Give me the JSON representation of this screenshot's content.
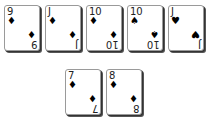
{
  "table": {
    "top_row": [
      {
        "rank": "9",
        "suit": "♦",
        "suit_name": "diamonds"
      },
      {
        "rank": "J",
        "suit": "♦",
        "suit_name": "diamonds"
      },
      {
        "rank": "10",
        "suit": "♦",
        "suit_name": "diamonds"
      },
      {
        "rank": "10",
        "suit": "♠",
        "suit_name": "spades"
      },
      {
        "rank": "J",
        "suit": "♥",
        "suit_name": "hearts"
      }
    ],
    "bottom_row": [
      {
        "rank": "7",
        "suit": "♦",
        "suit_name": "diamonds"
      },
      {
        "rank": "8",
        "suit": "♦",
        "suit_name": "diamonds"
      }
    ]
  }
}
